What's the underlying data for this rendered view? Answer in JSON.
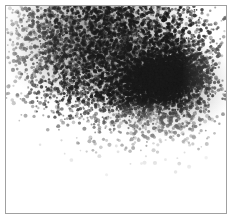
{
  "image": {
    "kind": "grayscale-dot-density-scan",
    "width": 235,
    "height": 223,
    "background_color": "#ffffff",
    "caption": "",
    "frame": {
      "name": "scan-plate-border",
      "color": "#a0a0a0",
      "border_width": 1,
      "left": 5,
      "top": 5,
      "width": 222,
      "height": 209
    }
  },
  "chart_data": {
    "type": "scatter",
    "title": "",
    "subtitle": "",
    "xlabel": "",
    "ylabel": "",
    "xlim": [
      0,
      222
    ],
    "ylim": [
      0,
      209
    ],
    "grid": false,
    "legend": null,
    "axis_visible": false,
    "tick_labels_x": [],
    "tick_labels_y": [],
    "annotations": [],
    "colormap": [
      "#ffffff",
      "#000000"
    ],
    "point_color": "#1a1a1a",
    "point_size_px": 1.4,
    "total_points": 10500,
    "series": [
      {
        "name": "diffuse-cloud",
        "distribution": "gaussian-2d",
        "center_x": 93,
        "center_y": 33,
        "sigma_x": 62,
        "sigma_y": 42,
        "rotation_deg": 0,
        "n_points": 5200,
        "peak_density": 0.55
      },
      {
        "name": "halo",
        "distribution": "gaussian-2d",
        "center_x": 156,
        "center_y": 79,
        "sigma_x": 44,
        "sigma_y": 32,
        "rotation_deg": -12,
        "n_points": 2600,
        "peak_density": 0.62
      },
      {
        "name": "hotspot-core",
        "distribution": "gaussian-2d",
        "center_x": 158,
        "center_y": 73,
        "sigma_x": 20,
        "sigma_y": 12,
        "rotation_deg": -12,
        "n_points": 2700,
        "peak_density": 0.98
      }
    ],
    "features": [
      {
        "name": "hotspot",
        "label": "",
        "center_x": 158,
        "center_y": 73,
        "width": 55,
        "height": 32,
        "tilt_deg": -12,
        "intensity": "near-black"
      },
      {
        "name": "cloud-peak",
        "label": "",
        "center_x": 93,
        "center_y": 33,
        "width": 150,
        "height": 95,
        "tilt_deg": 0,
        "intensity": "medium-gray"
      },
      {
        "name": "blank-region",
        "label": "",
        "center_x": 95,
        "center_y": 175,
        "width": 200,
        "height": 70,
        "tilt_deg": 0,
        "intensity": "white"
      }
    ]
  }
}
